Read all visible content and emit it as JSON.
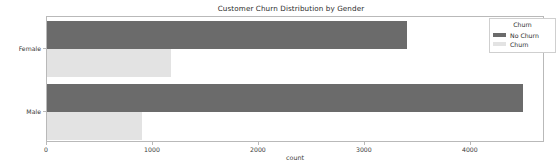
{
  "chart_data": {
    "type": "bar",
    "orientation": "horizontal",
    "title": "Customer Churn Distribution by Gender",
    "xlabel": "count",
    "ylabel": "Gender",
    "categories": [
      "Female",
      "Male"
    ],
    "series": [
      {
        "name": "No Churn",
        "values": [
          3400,
          4490
        ],
        "color": "#6b6b6b"
      },
      {
        "name": "Churn",
        "values": [
          1170,
          900
        ],
        "color": "#e3e3e3"
      }
    ],
    "legend": {
      "title": "Churn",
      "position": "upper right",
      "entries": [
        {
          "label": "No Churn",
          "color": "#6b6b6b"
        },
        {
          "label": "Churn",
          "color": "#e3e3e3"
        }
      ]
    },
    "xlim": [
      0,
      4700
    ],
    "xticks": [
      0,
      1000,
      2000,
      3000,
      4000
    ],
    "xtick_labels": [
      "0",
      "1000",
      "2000",
      "3000",
      "4000"
    ],
    "ytick_labels": [
      "Female",
      "Male"
    ],
    "grid": false
  }
}
